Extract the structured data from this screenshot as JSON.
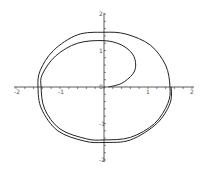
{
  "chart_data": {
    "type": "line",
    "title": "",
    "xlabel": "",
    "ylabel": "",
    "xlim": [
      -2,
      2
    ],
    "ylim": [
      -2,
      2
    ],
    "grid": false,
    "legend": null,
    "x_ticks": [
      "-2",
      "-1",
      "0",
      "1",
      "2"
    ],
    "y_ticks": [
      "-2",
      "-1",
      "0",
      "1",
      "2"
    ],
    "series": [
      {
        "name": "parametric spiral curve",
        "color": "#222222",
        "description": "Curve starts near origin, loops right to (0.75,0.6), up-left to (0,1.27), around inner ellipse through (-1.43,0),(0,-1.45),(1.5,0), then outer loop through (0,1.5),(-1.5,0),(0,-1.52),(1.53,0)",
        "points": [
          [
            0.1,
            0.0
          ],
          [
            0.4,
            0.1
          ],
          [
            0.65,
            0.35
          ],
          [
            0.72,
            0.6
          ],
          [
            0.65,
            0.9
          ],
          [
            0.4,
            1.15
          ],
          [
            0.0,
            1.27
          ],
          [
            -0.6,
            1.2
          ],
          [
            -1.1,
            0.85
          ],
          [
            -1.4,
            0.35
          ],
          [
            -1.43,
            0.0
          ],
          [
            -1.35,
            -0.6
          ],
          [
            -1.0,
            -1.15
          ],
          [
            -0.4,
            -1.42
          ],
          [
            0.0,
            -1.45
          ],
          [
            0.6,
            -1.38
          ],
          [
            1.15,
            -1.0
          ],
          [
            1.45,
            -0.45
          ],
          [
            1.5,
            0.0
          ],
          [
            1.4,
            0.6
          ],
          [
            1.05,
            1.15
          ],
          [
            0.5,
            1.45
          ],
          [
            0.0,
            1.5
          ],
          [
            -0.6,
            1.43
          ],
          [
            -1.15,
            1.0
          ],
          [
            -1.45,
            0.45
          ],
          [
            -1.5,
            0.0
          ],
          [
            -1.42,
            -0.6
          ],
          [
            -1.05,
            -1.2
          ],
          [
            -0.45,
            -1.48
          ],
          [
            0.0,
            -1.52
          ],
          [
            0.6,
            -1.45
          ],
          [
            1.2,
            -1.0
          ],
          [
            1.5,
            -0.45
          ],
          [
            1.53,
            0.0
          ]
        ]
      }
    ]
  }
}
